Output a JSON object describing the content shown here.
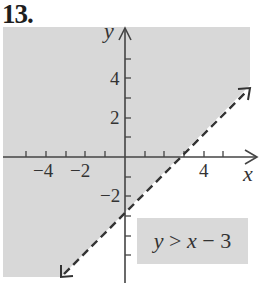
{
  "problem": {
    "number": "13."
  },
  "colors": {
    "shade": "#d8d8d8",
    "axis": "#444444",
    "line": "#333333",
    "box": "#d9d9d9"
  },
  "graph": {
    "x_axis_label": "x",
    "y_axis_label": "y",
    "x_tick_labels": [
      {
        "value": -4,
        "text": "−4"
      },
      {
        "value": -2,
        "text": "−2"
      },
      {
        "value": 4,
        "text": "4"
      }
    ],
    "y_tick_labels": [
      {
        "value": 4,
        "text": "4"
      },
      {
        "value": 2,
        "text": "2"
      },
      {
        "value": -2,
        "text": "−2"
      }
    ],
    "boundary_line": {
      "equation": "y = x - 3",
      "style": "dashed",
      "slope": 1,
      "intercept": -3
    },
    "shaded_region": "above line",
    "inequality": {
      "lhs": "y",
      "op": ">",
      "rhs_var": "x",
      "rhs_rest": "− 3",
      "full": "y > x − 3"
    }
  }
}
